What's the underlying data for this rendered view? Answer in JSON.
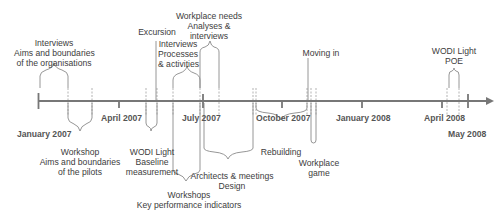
{
  "axis": {
    "color": "#777777",
    "dates": [
      {
        "label": "January 2007",
        "x": 39
      },
      {
        "label": "April 2007",
        "x": 119
      },
      {
        "label": "July 2007",
        "x": 203
      },
      {
        "label": "October 2007",
        "x": 282
      },
      {
        "label": "January 2008",
        "x": 362
      },
      {
        "label": "April 2008",
        "x": 442
      },
      {
        "label": "May 2008",
        "x": 468
      }
    ]
  },
  "events_above": [
    {
      "id": "interviews-orgs",
      "lines": "Interviews\nAims and boundaries\nof the organisations"
    },
    {
      "id": "excursion",
      "lines": "Excursion"
    },
    {
      "id": "interviews-processes",
      "lines": "Interviews\nProcesses\n& activities"
    },
    {
      "id": "workplace-needs",
      "lines": "Workplace needs\nAnalyses &\ninterviews"
    },
    {
      "id": "moving-in",
      "lines": "Moving in"
    },
    {
      "id": "wodi-poe",
      "lines": "WODI Light\nPOE"
    }
  ],
  "events_below": [
    {
      "id": "workshop-pilots",
      "lines": "Workshop\nAims and boundaries\nof the pilots"
    },
    {
      "id": "wodi-baseline",
      "lines": "WODI Light\nBaseline\nmeasurement"
    },
    {
      "id": "workshops-kpi",
      "lines": "Workshops\nKey performance indicators"
    },
    {
      "id": "architects-design",
      "lines": "Architects & meetings\nDesign"
    },
    {
      "id": "rebuilding",
      "lines": "Rebuilding"
    },
    {
      "id": "workplace-game",
      "lines": "Workplace\ngame"
    }
  ]
}
